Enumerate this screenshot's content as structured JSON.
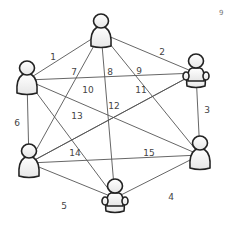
{
  "diagram": {
    "type": "complete-graph",
    "colors": {
      "edge": "#555555",
      "label": "#444444",
      "node_stroke": "#222222",
      "node_fill_top": "#ffffff",
      "node_fill_bottom": "#e6e6e6"
    },
    "corner_mark": "9",
    "nodes": [
      {
        "id": "n1",
        "kind": "person-standing",
        "x": 101,
        "y": 33
      },
      {
        "id": "n2",
        "kind": "person-sitting",
        "x": 196,
        "y": 73
      },
      {
        "id": "n3",
        "kind": "person-standing",
        "x": 200,
        "y": 155
      },
      {
        "id": "n4",
        "kind": "person-sitting",
        "x": 115,
        "y": 198
      },
      {
        "id": "n5",
        "kind": "person-standing",
        "x": 29,
        "y": 163
      },
      {
        "id": "n6",
        "kind": "person-standing",
        "x": 27,
        "y": 80
      }
    ],
    "edges": [
      {
        "label": "1",
        "from": "n6",
        "to": "n1",
        "lx": 53,
        "ly": 60
      },
      {
        "label": "2",
        "from": "n1",
        "to": "n2",
        "lx": 162,
        "ly": 55
      },
      {
        "label": "3",
        "from": "n2",
        "to": "n3",
        "lx": 207,
        "ly": 113
      },
      {
        "label": "4",
        "from": "n3",
        "to": "n4",
        "lx": 171,
        "ly": 200
      },
      {
        "label": "5",
        "from": "n4",
        "to": "n5",
        "lx": 64,
        "ly": 209
      },
      {
        "label": "6",
        "from": "n5",
        "to": "n6",
        "lx": 17,
        "ly": 126
      },
      {
        "label": "7",
        "from": "n1",
        "to": "n5",
        "lx": 74,
        "ly": 75
      },
      {
        "label": "8",
        "from": "n1",
        "to": "n4",
        "lx": 110,
        "ly": 75
      },
      {
        "label": "9",
        "from": "n1",
        "to": "n3",
        "lx": 139,
        "ly": 74
      },
      {
        "label": "10",
        "from": "n6",
        "to": "n2",
        "lx": 88,
        "ly": 93
      },
      {
        "label": "11",
        "from": "n6",
        "to": "n3",
        "lx": 141,
        "ly": 93
      },
      {
        "label": "12",
        "from": "n5",
        "to": "n2",
        "lx": 114,
        "ly": 109
      },
      {
        "label": "13",
        "from": "n6",
        "to": "n4",
        "lx": 77,
        "ly": 119
      },
      {
        "label": "14",
        "from": "n2",
        "to": "n5",
        "lx": 75,
        "ly": 156
      },
      {
        "label": "15",
        "from": "n5",
        "to": "n3",
        "lx": 149,
        "ly": 156
      }
    ]
  }
}
